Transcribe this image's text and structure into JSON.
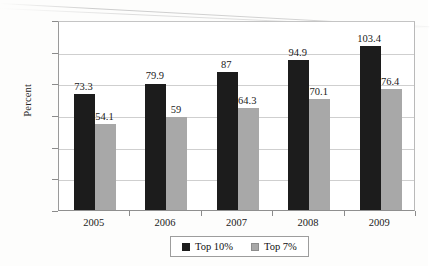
{
  "chart_data": {
    "type": "bar",
    "title": "",
    "xlabel": "",
    "ylabel": "Percent",
    "ylim": [
      0,
      120
    ],
    "yticks": [
      0,
      20,
      40,
      60,
      80,
      100,
      120
    ],
    "grid": true,
    "legend_position": "bottom",
    "categories": [
      "2005",
      "2006",
      "2007",
      "2008",
      "2009"
    ],
    "series": [
      {
        "name": "Top 10%",
        "color": "#1c1c1c",
        "values": [
          73.3,
          79.9,
          87,
          94.9,
          103.4
        ],
        "labels": [
          "73.3",
          "79.9",
          "87",
          "94.9",
          "103.4"
        ]
      },
      {
        "name": "Top 7%",
        "color": "#a8a8a8",
        "values": [
          54.1,
          59,
          64.3,
          70.1,
          76.4
        ],
        "labels": [
          "54.1",
          "59",
          "64.3",
          "70.1",
          "76.4"
        ]
      }
    ]
  },
  "axis": {
    "y_tick_labels": [
      "120",
      "100",
      "80",
      "60",
      "40",
      "20",
      "0"
    ],
    "y_title": "Percent",
    "x_tick_labels": [
      "2005",
      "2006",
      "2007",
      "2008",
      "2009"
    ]
  },
  "legend": {
    "items": [
      {
        "label": "Top 10%",
        "swatch": "dark-square-swatch"
      },
      {
        "label": "Top 7%",
        "swatch": "gray-square-swatch"
      }
    ]
  },
  "artifacts": {
    "cropped_title_text": ""
  }
}
